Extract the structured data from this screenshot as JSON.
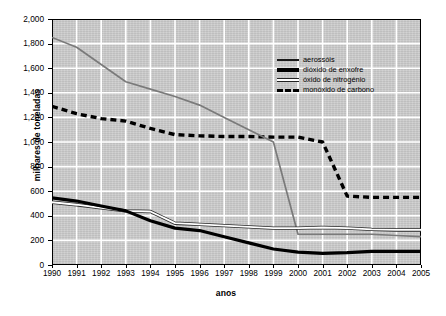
{
  "chart_data": {
    "type": "line",
    "title": "",
    "xlabel": "anos",
    "ylabel": "milhares de toneladas",
    "grid": true,
    "legend_position": "top-right-inside",
    "x": [
      1990,
      1991,
      1992,
      1993,
      1994,
      1995,
      1996,
      1997,
      1998,
      1999,
      2000,
      2001,
      2002,
      2003,
      2004,
      2005
    ],
    "categories": [
      "1990",
      "1991",
      "1992",
      "1993",
      "1994",
      "1995",
      "1996",
      "1997",
      "1998",
      "1999",
      "2000",
      "2001",
      "2002",
      "2003",
      "2004",
      "2005"
    ],
    "xlim": [
      1990,
      2005
    ],
    "ylim": [
      0,
      2000
    ],
    "y_ticks": [
      0,
      200,
      400,
      600,
      800,
      1000,
      1200,
      1400,
      1600,
      1800,
      2000
    ],
    "y_tick_labels": [
      "0",
      "200",
      "400",
      "600",
      "800",
      "1,000",
      "1,200",
      "1,400",
      "1,600",
      "1,800",
      "2,000"
    ],
    "series": [
      {
        "name": "aerossóis",
        "style": "solid-thin-gray",
        "color": "#7a7a7a",
        "values": [
          1850,
          1770,
          1630,
          1490,
          1430,
          1370,
          1300,
          1200,
          1100,
          1000,
          250,
          250,
          250,
          250,
          240,
          230
        ]
      },
      {
        "name": "dióxido de enxofre",
        "style": "solid-thick-black",
        "color": "#000000",
        "values": [
          545,
          520,
          480,
          440,
          360,
          300,
          280,
          230,
          180,
          130,
          105,
          95,
          100,
          110,
          110,
          110
        ]
      },
      {
        "name": "óxido de nitrogénio",
        "style": "solid-outlined-white",
        "color": "#ffffff",
        "values": [
          510,
          490,
          465,
          440,
          435,
          340,
          330,
          320,
          310,
          300,
          300,
          305,
          300,
          290,
          285,
          285
        ]
      },
      {
        "name": "monóxido de carbono",
        "style": "dashed-thick-black",
        "color": "#000000",
        "values": [
          1290,
          1230,
          1190,
          1170,
          1110,
          1060,
          1050,
          1045,
          1045,
          1040,
          1040,
          1000,
          560,
          550,
          550,
          550
        ]
      }
    ],
    "notes": {
      "crossing": "aerossóis crosses monóxido de carbono between 1999 and 2000",
      "aerosol_drop": "aerossóis falls steeply from 1000 at 1999 to 250 at 2000"
    }
  },
  "legend": {
    "items": [
      {
        "label": "aerossóis"
      },
      {
        "label": "dióxido de enxofre"
      },
      {
        "label": "óxido de nitrogénio"
      },
      {
        "label": "monóxido de carbono"
      }
    ]
  },
  "colors": {
    "plot_background": "#c9c9c9",
    "gridlines": "#ffffff",
    "axis": "#000000",
    "aerosol_line": "#7a7a7a",
    "sulfur_line": "#000000",
    "nitrogen_line": "#ffffff",
    "carbon_line": "#000000"
  }
}
